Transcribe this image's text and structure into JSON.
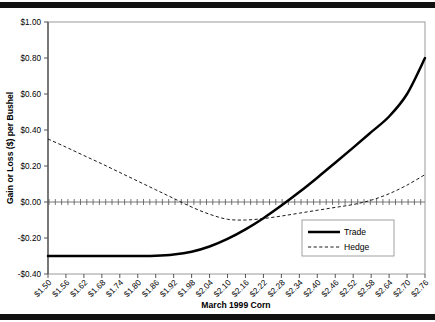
{
  "figure": {
    "top_rule": "horizontal-rule",
    "bottom_rule": "horizontal-rule"
  },
  "chart_data": {
    "type": "line",
    "title": "",
    "xlabel": "March 1999 Corn",
    "ylabel": "Gain or Loss ($) per Bushel",
    "grid": false,
    "legend_position": "bottom-right",
    "ylim": [
      -0.4,
      1.0
    ],
    "yticks": [
      1.0,
      0.8,
      0.6,
      0.4,
      0.2,
      0.0,
      -0.2,
      -0.4
    ],
    "ytick_labels": [
      "$1.00",
      "$0.80",
      "$0.60",
      "$0.40",
      "$0.20",
      "$0.00",
      "-$0.20",
      "-$0.40"
    ],
    "categories": [
      "$1.50",
      "$1.56",
      "$1.62",
      "$1.68",
      "$1.74",
      "$1.80",
      "$1.86",
      "$1.92",
      "$1.98",
      "$2.04",
      "$2.10",
      "$2.16",
      "$2.22",
      "$2.28",
      "$2.34",
      "$2.40",
      "$2.46",
      "$2.52",
      "$2.58",
      "$2.64",
      "$2.70",
      "$2.76"
    ],
    "x_values": [
      1.5,
      1.56,
      1.62,
      1.68,
      1.74,
      1.8,
      1.86,
      1.92,
      1.98,
      2.04,
      2.1,
      2.16,
      2.22,
      2.28,
      2.34,
      2.4,
      2.46,
      2.52,
      2.58,
      2.64,
      2.7,
      2.76
    ],
    "series": [
      {
        "name": "Trade",
        "style": "solid-thick",
        "color": "#000000",
        "values": [
          -0.3,
          -0.3,
          -0.3,
          -0.3,
          -0.3,
          -0.3,
          -0.299,
          -0.292,
          -0.276,
          -0.247,
          -0.205,
          -0.152,
          -0.09,
          -0.02,
          0.055,
          0.135,
          0.218,
          0.302,
          0.388,
          0.475,
          0.6,
          0.8
        ]
      },
      {
        "name": "Hedge",
        "style": "dashed",
        "color": "#000000",
        "values": [
          0.35,
          0.305,
          0.258,
          0.212,
          0.164,
          0.116,
          0.068,
          0.02,
          -0.028,
          -0.068,
          -0.096,
          -0.1,
          -0.092,
          -0.078,
          -0.062,
          -0.046,
          -0.03,
          -0.014,
          0.01,
          0.046,
          0.094,
          0.152
        ]
      },
      {
        "name": "zero-reference",
        "style": "cross-ticks",
        "color": "#555555",
        "constant": 0.0
      }
    ],
    "legend": [
      {
        "label": "Trade",
        "style": "solid-thick"
      },
      {
        "label": "Hedge",
        "style": "dashed"
      }
    ]
  }
}
